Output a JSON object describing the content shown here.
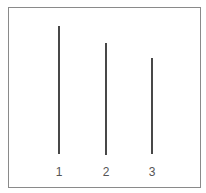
{
  "diagram": {
    "type": "line-length-comparison",
    "line_color": "#1a1a1a",
    "frame_color": "#8a8a8a",
    "lines": [
      {
        "label": "1",
        "x": 59,
        "y_top": 26,
        "y_bottom": 154
      },
      {
        "label": "2",
        "x": 106,
        "y_top": 43,
        "y_bottom": 155
      },
      {
        "label": "3",
        "x": 152,
        "y_top": 58,
        "y_bottom": 154
      }
    ]
  }
}
